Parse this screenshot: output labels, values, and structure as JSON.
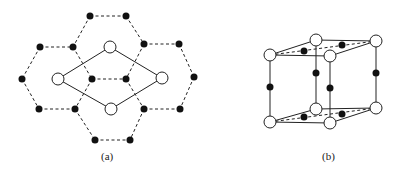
{
  "figure": {
    "panel_a": {
      "caption": "(a)",
      "open_atoms": [
        [
          110,
          47
        ],
        [
          58,
          79
        ],
        [
          162,
          78
        ],
        [
          111,
          109
        ]
      ],
      "filled_atoms": [
        [
          90,
          16
        ],
        [
          126,
          16
        ],
        [
          40,
          47
        ],
        [
          73,
          47
        ],
        [
          144,
          44
        ],
        [
          179,
          44
        ],
        [
          22,
          79
        ],
        [
          92,
          79
        ],
        [
          126,
          79
        ],
        [
          194,
          77
        ],
        [
          39,
          109
        ],
        [
          75,
          109
        ],
        [
          144,
          109
        ],
        [
          180,
          109
        ],
        [
          95,
          140
        ],
        [
          130,
          140
        ]
      ],
      "solid_bonds": [
        [
          58,
          79,
          110,
          47
        ],
        [
          110,
          47,
          162,
          78
        ],
        [
          162,
          78,
          111,
          109
        ],
        [
          111,
          109,
          58,
          79
        ]
      ],
      "dashed_bonds": [
        [
          90,
          16,
          126,
          16
        ],
        [
          90,
          16,
          73,
          47
        ],
        [
          126,
          16,
          144,
          44
        ],
        [
          40,
          47,
          73,
          47
        ],
        [
          144,
          44,
          179,
          44
        ],
        [
          40,
          47,
          22,
          79
        ],
        [
          179,
          44,
          194,
          77
        ],
        [
          73,
          47,
          92,
          79
        ],
        [
          144,
          44,
          126,
          79
        ],
        [
          92,
          79,
          126,
          79
        ],
        [
          22,
          79,
          39,
          109
        ],
        [
          194,
          77,
          180,
          109
        ],
        [
          92,
          79,
          75,
          109
        ],
        [
          126,
          79,
          144,
          109
        ],
        [
          39,
          109,
          75,
          109
        ],
        [
          144,
          109,
          180,
          109
        ],
        [
          75,
          109,
          95,
          140
        ],
        [
          144,
          109,
          130,
          140
        ],
        [
          95,
          140,
          130,
          140
        ]
      ]
    },
    "panel_b": {
      "caption": "(b)",
      "open_atoms": [
        [
          270,
          55
        ],
        [
          316,
          40
        ],
        [
          330,
          56
        ],
        [
          376,
          41
        ],
        [
          270,
          122
        ],
        [
          316,
          109
        ],
        [
          330,
          123
        ],
        [
          376,
          108
        ]
      ],
      "filled_atoms": [
        [
          304,
          51
        ],
        [
          342,
          45
        ],
        [
          270,
          87
        ],
        [
          316,
          73
        ],
        [
          330,
          88
        ],
        [
          376,
          73
        ],
        [
          304,
          117
        ],
        [
          342,
          114
        ]
      ],
      "solid_bonds": [
        [
          270,
          55,
          316,
          40
        ],
        [
          316,
          40,
          376,
          41
        ],
        [
          376,
          41,
          330,
          56
        ],
        [
          330,
          56,
          270,
          55
        ],
        [
          270,
          122,
          316,
          109
        ],
        [
          316,
          109,
          376,
          108
        ],
        [
          376,
          108,
          330,
          123
        ],
        [
          330,
          123,
          270,
          122
        ],
        [
          270,
          55,
          270,
          122
        ],
        [
          330,
          56,
          330,
          123
        ],
        [
          376,
          41,
          376,
          108
        ],
        [
          316,
          40,
          316,
          109
        ]
      ],
      "dashed_bonds": [
        [
          270,
          55,
          376,
          41
        ],
        [
          270,
          122,
          376,
          108
        ]
      ]
    }
  }
}
